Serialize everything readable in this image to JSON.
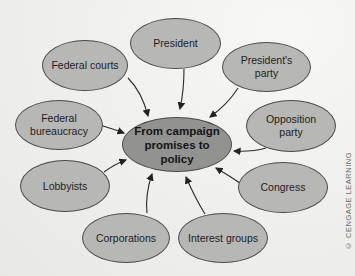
{
  "diagram": {
    "type": "hub-and-spoke concept map",
    "center": {
      "label": "From campaign promises to policy"
    },
    "nodes": [
      {
        "id": "president",
        "label": "President"
      },
      {
        "id": "presidents-party",
        "label": "President's party"
      },
      {
        "id": "opposition-party",
        "label": "Opposition party"
      },
      {
        "id": "congress",
        "label": "Congress"
      },
      {
        "id": "interest-groups",
        "label": "Interest groups"
      },
      {
        "id": "corporations",
        "label": "Corporations"
      },
      {
        "id": "lobbyists",
        "label": "Lobbyists"
      },
      {
        "id": "federal-bureaucracy",
        "label": "Federal bureaucracy"
      },
      {
        "id": "federal-courts",
        "label": "Federal courts"
      }
    ],
    "edge_direction": "all nodes point to center",
    "credit": "© CENGAGE LEARNING"
  },
  "colors": {
    "node_fill": "#b7b7b5",
    "center_fill": "#929290",
    "outline": "#4a4a4a",
    "background": "#f1f1ef"
  }
}
